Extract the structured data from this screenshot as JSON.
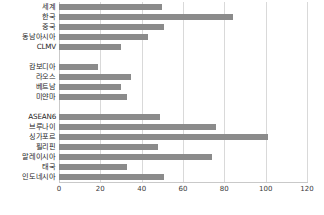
{
  "chart_data": {
    "type": "bar",
    "orientation": "horizontal",
    "title": "",
    "subtitle": "",
    "xlabel": "",
    "ylabel": "",
    "xlim": [
      0,
      120
    ],
    "xticks": [
      0,
      20,
      40,
      60,
      80,
      100,
      120
    ],
    "grid": true,
    "legend": false,
    "bar_color": "#8b8b8b",
    "categories": [
      "세계",
      "한국",
      "중국",
      "동남아시아",
      "CLMV",
      "캄보디아",
      "라오스",
      "베트남",
      "미얀마",
      "ASEAN6",
      "브루나이",
      "싱가포르",
      "필리핀",
      "말레이시아",
      "태국",
      "인도네시아"
    ],
    "values": [
      50,
      84,
      51,
      43,
      30,
      19,
      35,
      30,
      33,
      49,
      76,
      101,
      48,
      74,
      33,
      51
    ],
    "gaps_after": [
      4,
      8
    ]
  }
}
